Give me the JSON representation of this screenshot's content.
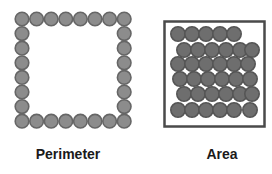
{
  "diagram": {
    "perimeter": {
      "label": "Perimeter",
      "circles_per_side": 8,
      "circle_fill": "#8c8c8c",
      "circle_stroke": "#666666"
    },
    "area": {
      "label": "Area",
      "box_stroke": "#4a4a4a",
      "circle_fill": "#6e6e6e",
      "circle_stroke": "#555555",
      "rows": 6
    }
  }
}
